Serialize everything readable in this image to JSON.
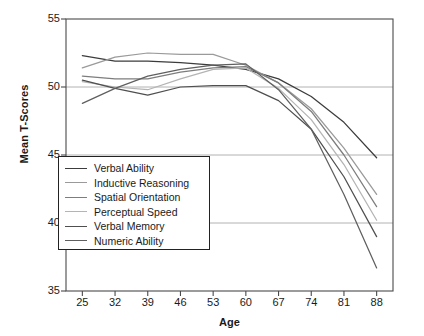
{
  "chart_data": {
    "type": "line",
    "title": "",
    "xlabel": "Age",
    "ylabel": "Mean T-Scores",
    "xlim": [
      21.5,
      91.5
    ],
    "ylim": [
      35,
      55
    ],
    "xticks": [
      25,
      32,
      39,
      46,
      53,
      60,
      67,
      74,
      81,
      88
    ],
    "yticks": [
      35,
      40,
      45,
      50,
      55
    ],
    "grid": "horizontal",
    "legend_position": "lower-left-inside",
    "x": [
      25,
      32,
      39,
      46,
      53,
      60,
      67,
      74,
      81,
      88
    ],
    "series": [
      {
        "name": "Verbal Ability",
        "color": "#3c3c3c",
        "values": [
          52.3,
          51.9,
          51.9,
          51.8,
          51.6,
          51.3,
          50.6,
          49.3,
          47.4,
          44.8
        ]
      },
      {
        "name": "Inductive Reasoning",
        "color": "#9a9a9a",
        "values": [
          51.4,
          52.2,
          52.5,
          52.4,
          52.4,
          51.6,
          50.3,
          48.4,
          45.5,
          42.1
        ]
      },
      {
        "name": "Spatial Orientation",
        "color": "#7d7d7d",
        "values": [
          50.8,
          50.6,
          50.6,
          51.1,
          51.4,
          51.5,
          50.3,
          48.2,
          45.0,
          41.2
        ]
      },
      {
        "name": "Perceptual Speed",
        "color": "#b4b4b4",
        "values": [
          50.4,
          50.0,
          49.8,
          50.6,
          51.3,
          51.4,
          49.9,
          47.6,
          44.3,
          40.2
        ]
      },
      {
        "name": "Verbal Memory",
        "color": "#4f4f4f",
        "values": [
          50.5,
          49.9,
          49.4,
          50.0,
          50.1,
          50.1,
          49.0,
          46.9,
          43.4,
          39.0
        ]
      },
      {
        "name": "Numeric Ability",
        "color": "#5f5f5f",
        "values": [
          48.8,
          49.9,
          50.8,
          51.3,
          51.6,
          51.7,
          49.8,
          46.9,
          42.1,
          36.7
        ]
      }
    ]
  },
  "axes": {
    "ylabel": "Mean T-Scores",
    "xlabel": "Age",
    "yticks": [
      "55",
      "50",
      "45",
      "40",
      "35"
    ],
    "xticks": [
      "25",
      "32",
      "39",
      "46",
      "53",
      "60",
      "67",
      "74",
      "81",
      "88"
    ]
  },
  "legend": {
    "items": [
      {
        "label": "Verbal Ability",
        "color": "#3c3c3c"
      },
      {
        "label": "Inductive Reasoning",
        "color": "#9a9a9a"
      },
      {
        "label": "Spatial Orientation",
        "color": "#7d7d7d"
      },
      {
        "label": "Perceptual Speed",
        "color": "#b4b4b4"
      },
      {
        "label": "Verbal Memory",
        "color": "#4f4f4f"
      },
      {
        "label": "Numeric Ability",
        "color": "#5f5f5f"
      }
    ]
  }
}
